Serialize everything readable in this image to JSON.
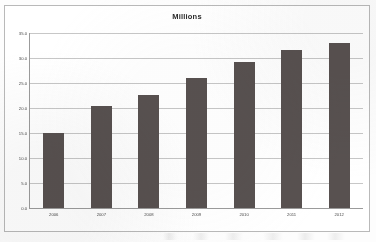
{
  "chart_data": {
    "type": "bar",
    "title": "Millions",
    "xlabel": "",
    "ylabel": "",
    "categories": [
      "2006",
      "2007",
      "2008",
      "2009",
      "2010",
      "2011",
      "2012"
    ],
    "values": [
      15.1,
      20.5,
      22.7,
      26.1,
      29.3,
      31.7,
      33.1
    ],
    "ylim": [
      0.0,
      35.0
    ],
    "ytick_values": [
      35.0,
      30.0,
      25.0,
      20.0,
      15.0,
      10.0,
      5.0,
      0.0
    ],
    "ytick_labels": [
      "35.0",
      "30.0",
      "25.0",
      "20.0",
      "15.0",
      "10.0",
      "5.0",
      "0.0"
    ],
    "grid": true,
    "legend": false,
    "bar_color": "#585150",
    "gridline_color": "#c7c7c7",
    "axis_color": "#9b9b9b",
    "plot_background": "#ffffff"
  }
}
